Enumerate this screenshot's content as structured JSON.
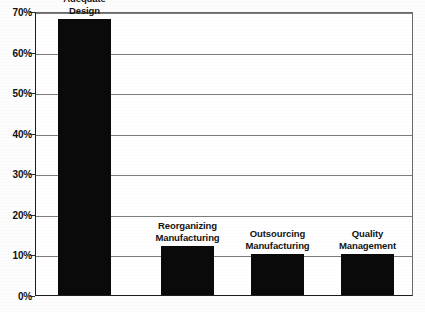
{
  "chart_data": {
    "type": "bar",
    "title": "",
    "xlabel": "",
    "ylabel": "",
    "ylim": [
      0,
      70
    ],
    "grid": true,
    "legend": "none",
    "orientation": "vertical",
    "bar_color": "#0a0a0a",
    "categories": [
      "Market-Adequate Design",
      "Reorganizing Manufacturing",
      "Outsourcing Manufacturing",
      "Quality Management"
    ],
    "values": [
      68,
      12,
      10,
      10
    ],
    "value_labels": [
      "68%",
      "12%",
      "10%",
      "10%"
    ],
    "yticks": [
      0,
      10,
      20,
      30,
      40,
      50,
      60,
      70
    ],
    "ytick_labels": [
      "0%",
      "10%",
      "20%",
      "30%",
      "40%",
      "50%",
      "60%",
      "70%"
    ]
  },
  "bars": [
    {
      "label_lines": [
        "Market-",
        "Adequate",
        "Design"
      ],
      "value": 68,
      "left_px": 57,
      "width_px": 53
    },
    {
      "label_lines": [
        "Reorganizing",
        "Manufacturing"
      ],
      "value": 12,
      "left_px": 160,
      "width_px": 53
    },
    {
      "label_lines": [
        "Outsourcing",
        "Manufacturing"
      ],
      "value": 10,
      "left_px": 250,
      "width_px": 53
    },
    {
      "label_lines": [
        "Quality",
        "Management"
      ],
      "value": 10,
      "left_px": 340,
      "width_px": 53
    }
  ],
  "axis": {
    "ticks": [
      {
        "label": "70%",
        "value": 70
      },
      {
        "label": "60%",
        "value": 60
      },
      {
        "label": "50%",
        "value": 50
      },
      {
        "label": "40%",
        "value": 40
      },
      {
        "label": "30%",
        "value": 30
      },
      {
        "label": "20%",
        "value": 20
      },
      {
        "label": "10%",
        "value": 10
      },
      {
        "label": "0%",
        "value": 0
      }
    ]
  },
  "colors": {
    "bar": "#0a0a0a",
    "gridline": "#7c7c7c",
    "axis": "#1d1d1d",
    "text": "#111111",
    "background": "#ffffff"
  }
}
